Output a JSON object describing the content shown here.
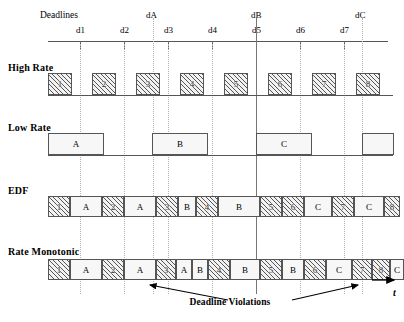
{
  "diagram": {
    "title_deadlines": "Deadlines",
    "axis_label": "t",
    "violations_label": "Deadline Violations"
  },
  "timeline": {
    "minor_ticks": [
      "d1",
      "d2",
      "d3",
      "d4",
      "d5",
      "d6",
      "d7"
    ],
    "major_ticks": [
      "dA",
      "dB",
      "dC"
    ]
  },
  "rows": [
    {
      "label": "High Rate"
    },
    {
      "label": "Low Rate"
    },
    {
      "label": "EDF"
    },
    {
      "label": "Rate Monotonic"
    }
  ],
  "high_rate": {
    "label": "High Rate",
    "blocks": [
      "1",
      "2",
      "3",
      "4",
      "5",
      "6",
      "7",
      "8"
    ]
  },
  "low_rate": {
    "label": "Low Rate",
    "blocks": [
      "A",
      "B",
      "C",
      ""
    ]
  },
  "edf": {
    "label": "EDF",
    "blocks": [
      "1",
      "A",
      "2",
      "A",
      "3",
      "B",
      "4",
      "B",
      "5",
      "6",
      "C",
      "7",
      "C",
      "8"
    ]
  },
  "rate_monotonic": {
    "label": "Rate Monotonic",
    "blocks": [
      "1",
      "A",
      "2",
      "A",
      "3",
      "A",
      "B",
      "4",
      "B",
      "5",
      "B",
      "6",
      "C",
      "7",
      "C",
      "8",
      "C"
    ]
  }
}
